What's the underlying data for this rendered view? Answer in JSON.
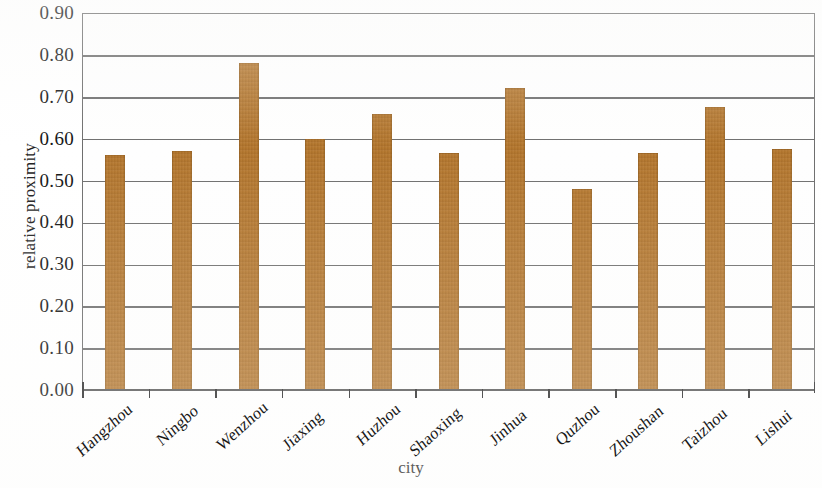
{
  "chart_data": {
    "type": "bar",
    "title": "",
    "xlabel": "city",
    "ylabel": "relative proximity",
    "categories": [
      "Hangzhou",
      "Ningbo",
      "Wenzhou",
      "Jiaxing",
      "Huzhou",
      "Shaoxing",
      "Jinhua",
      "Quzhou",
      "Zhoushan",
      "Taizhou",
      "Lishui"
    ],
    "values": [
      0.56,
      0.57,
      0.78,
      0.6,
      0.66,
      0.565,
      0.72,
      0.48,
      0.565,
      0.675,
      0.575
    ],
    "ylim": [
      0.0,
      0.9
    ],
    "ytick_labels": [
      "0.90",
      "0.80",
      "0.70",
      "0.60",
      "0.50",
      "0.40",
      "0.30",
      "0.20",
      "0.10",
      "0.00"
    ],
    "ytick_values": [
      0.9,
      0.8,
      0.7,
      0.6,
      0.5,
      0.4,
      0.3,
      0.2,
      0.1,
      0.0
    ],
    "grid": true,
    "legend": "none",
    "bar_color": "#b5762b",
    "axis_color": "#6f6f6f",
    "background_color": "#ffffff"
  }
}
